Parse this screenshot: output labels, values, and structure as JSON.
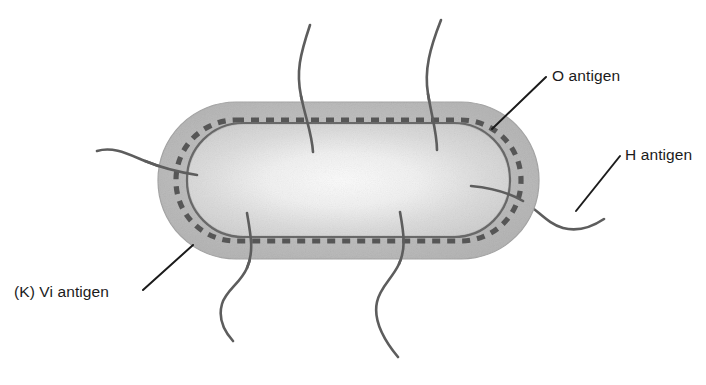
{
  "figure": {
    "background_color": "#ffffff",
    "ink_color": "#1b1b1b"
  },
  "labels": [
    {
      "id": "o-antigen",
      "text": "O antigen",
      "position": "top-right",
      "points_to": "dashed outer ring / lipopolysaccharide layer"
    },
    {
      "id": "h-antigen",
      "text": "H antigen",
      "position": "right",
      "points_to": "flagellum"
    },
    {
      "id": "k-vi-antigen",
      "text": "(K) Vi antigen",
      "position": "bottom-left",
      "points_to": "capsule layer"
    }
  ],
  "structures": {
    "capsule": {
      "name": "capsule",
      "fill_color": "#bcbcbc",
      "stroke_color": "#9a9a9a"
    },
    "vi_ring": {
      "name": "dashed antigen ring",
      "stroke_color": "#585858",
      "dash_pattern": "8 7"
    },
    "cell_wall": {
      "name": "cell wall",
      "stroke_color": "#6a6a6a"
    },
    "cytoplasm": {
      "name": "cytoplasm",
      "fill_color": "#f2f2f2"
    },
    "flagella": {
      "name": "flagella",
      "count": 6,
      "stroke_color": "#5d5d5d"
    }
  }
}
